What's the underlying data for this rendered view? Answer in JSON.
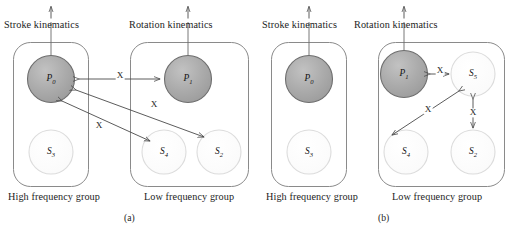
{
  "figure": {
    "caption_a": "(a)",
    "caption_b": "(b)",
    "edge_label": "X"
  },
  "panels": [
    {
      "id": "a",
      "caption": "(a)",
      "top_labels": [
        {
          "name": "stroke-kinematics",
          "text": "Stroke kinematics"
        },
        {
          "name": "rotation-kinematics",
          "text": "Rotation kinematics"
        }
      ],
      "groups": [
        {
          "name": "high-frequency-group",
          "label": "High frequency group"
        },
        {
          "name": "low-frequency-group",
          "label": "Low frequency group"
        }
      ],
      "nodes": [
        {
          "name": "node-p0",
          "label": "P",
          "sub": "0",
          "fill": "dark"
        },
        {
          "name": "node-s3",
          "label": "S",
          "sub": "3",
          "fill": "light"
        },
        {
          "name": "node-p1",
          "label": "P",
          "sub": "1",
          "fill": "dark"
        },
        {
          "name": "node-s4",
          "label": "S",
          "sub": "4",
          "fill": "light"
        },
        {
          "name": "node-s2",
          "label": "S",
          "sub": "2",
          "fill": "light"
        }
      ],
      "edges": [
        {
          "name": "edge-p0-p1",
          "from": "P0",
          "to": "P1",
          "label": "X"
        },
        {
          "name": "edge-p0-s2",
          "from": "P0",
          "to": "S2",
          "label": "X"
        },
        {
          "name": "edge-p0-s4",
          "from": "P0",
          "to": "S4",
          "label": "X"
        }
      ]
    },
    {
      "id": "b",
      "caption": "(b)",
      "top_labels": [
        {
          "name": "stroke-kinematics",
          "text": "Stroke kinematics"
        },
        {
          "name": "rotation-kinematics",
          "text": "Rotation kinematics"
        }
      ],
      "groups": [
        {
          "name": "high-frequency-group",
          "label": "High frequency group"
        },
        {
          "name": "low-frequency-group",
          "label": "Low frequency group"
        }
      ],
      "nodes": [
        {
          "name": "node-p0",
          "label": "P",
          "sub": "0",
          "fill": "dark"
        },
        {
          "name": "node-s3",
          "label": "S",
          "sub": "3",
          "fill": "light"
        },
        {
          "name": "node-p1",
          "label": "P",
          "sub": "1",
          "fill": "dark"
        },
        {
          "name": "node-s5",
          "label": "S",
          "sub": "5",
          "fill": "light"
        },
        {
          "name": "node-s4",
          "label": "S",
          "sub": "4",
          "fill": "light"
        },
        {
          "name": "node-s2",
          "label": "S",
          "sub": "2",
          "fill": "light"
        }
      ],
      "edges": [
        {
          "name": "edge-p1-s5",
          "from": "P1",
          "to": "S5",
          "label": "X"
        },
        {
          "name": "edge-s5-s4",
          "from": "S5",
          "to": "S4",
          "label": "X"
        },
        {
          "name": "edge-s5-s2",
          "from": "S5",
          "to": "S2",
          "label": "X"
        }
      ]
    }
  ],
  "colors": {
    "node_dark_fill": "#a8a8a8",
    "node_dark_stroke": "#6e6e6e",
    "node_light_fill": "#fcfcfc",
    "node_light_stroke": "#d8d8d8",
    "box_stroke": "#8a8a8a",
    "arrow_stroke": "#4a4a4a",
    "text": "#1c1c1c",
    "background": "#ffffff"
  }
}
